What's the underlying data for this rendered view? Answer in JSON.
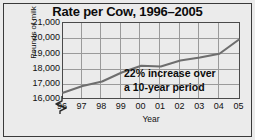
{
  "chart_data": {
    "type": "line",
    "title": "Rate per Cow, 1996–2005",
    "xlabel": "Year",
    "ylabel": "Pounds of milk",
    "categories": [
      "96",
      "97",
      "98",
      "99",
      "00",
      "01",
      "02",
      "03",
      "04",
      "05"
    ],
    "x_full_years": [
      1996,
      1997,
      1998,
      1999,
      2000,
      2001,
      2002,
      2003,
      2004,
      2005
    ],
    "values": [
      16350,
      16800,
      17100,
      17700,
      18150,
      18100,
      18500,
      18700,
      18950,
      19900
    ],
    "ylim": [
      16000,
      21000
    ],
    "yticks": [
      "16,000",
      "17,000",
      "18,000",
      "19,000",
      "20,000",
      "21,000"
    ],
    "ytick_values": [
      16000,
      17000,
      18000,
      19000,
      20000,
      21000
    ],
    "grid": true,
    "legend": "none",
    "y_axis_broken": true,
    "annotations": [
      "22% increase over",
      "a 10-year period"
    ],
    "series_color": "#6e6e6e",
    "grid_color": "#9a9a9a",
    "frame_color": "#3a3a3a",
    "background_color": "#ebebeb"
  }
}
